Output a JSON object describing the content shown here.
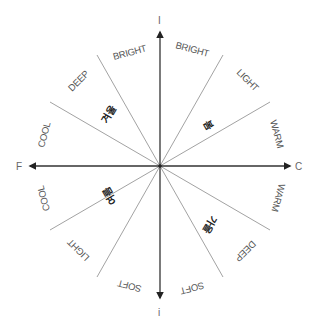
{
  "diagram": {
    "axes": {
      "top": "I",
      "bottom": "i",
      "left": "F",
      "right": "C"
    },
    "seasons": {
      "winter": "겨울",
      "spring": "봄",
      "summer": "여름",
      "autumn": "가을"
    },
    "sector_labels": {
      "top_left_bright": "BRIGHT",
      "top_right_bright": "BRIGHT",
      "top_right_light": "LIGHT",
      "right_upper_warm": "WARM",
      "right_lower_warm": "WARM",
      "bottom_right_deep": "DEEP",
      "bottom_right_soft": "SOFT",
      "bottom_left_soft": "SOFT",
      "bottom_left_light": "LIGHT",
      "left_lower_cool": "COOL",
      "left_upper_cool": "COOL",
      "top_left_deep": "DEEP"
    },
    "colors": {
      "axis": "#333333",
      "sector_line": "#8a8a8a",
      "label": "#555555",
      "season": "#222222"
    }
  }
}
